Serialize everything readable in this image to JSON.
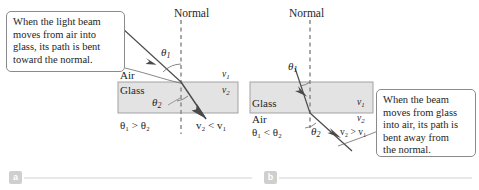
{
  "figure": {
    "width": 479,
    "height": 190,
    "background": "#ffffff",
    "ray_color": "#4a4a4a",
    "slab_fill": "#e3e3e3",
    "slab_stroke": "#9a9a9a",
    "dashed_color": "#8c8c8c"
  },
  "panel_a": {
    "tag": "a",
    "normal_label": "Normal",
    "medium_top": "Air",
    "medium_bottom": "Glass",
    "theta_incident": "θ",
    "theta_incident_sub": "1",
    "theta_refracted": "θ",
    "theta_refracted_sub": "2",
    "speed_top": "v",
    "speed_top_sub": "1",
    "speed_bottom": "v",
    "speed_bottom_sub": "2",
    "angle_relation": "θ₁ > θ₂",
    "speed_relation": "v₂ < v₁",
    "callout": {
      "line1": "When the light beam",
      "line2": "moves from air into",
      "line3": "glass, its path is bent",
      "line4": "toward the normal."
    }
  },
  "panel_b": {
    "tag": "b",
    "normal_label": "Normal",
    "medium_top": "Glass",
    "medium_bottom": "Air",
    "theta_incident": "θ",
    "theta_incident_sub": "1",
    "theta_refracted": "θ",
    "theta_refracted_sub": "2",
    "speed_top": "v",
    "speed_top_sub": "1",
    "speed_bottom": "v",
    "speed_bottom_sub": "2",
    "angle_relation": "θ₁ < θ₂",
    "speed_relation": "v₂ > v₁",
    "callout": {
      "line1": "When the beam",
      "line2": "moves from glass",
      "line3": "into air, its path is",
      "line4": "bent away from",
      "line5": "the normal."
    }
  },
  "footer": {
    "rule_color": "#e0e0e0"
  }
}
